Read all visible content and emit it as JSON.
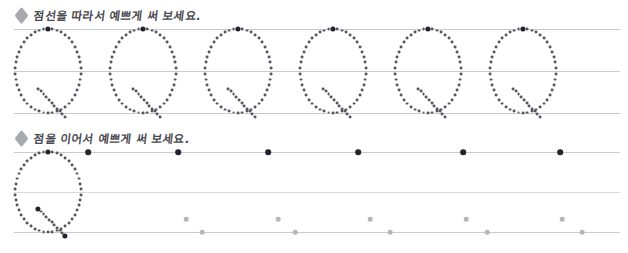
{
  "page": {
    "background_color": "#ffffff"
  },
  "colors": {
    "guide_line": "#c9c9d0",
    "guide_line_soft": "#d9d9df",
    "trace_dot": "#55555f",
    "start_dot": "#23232d",
    "pale_dot": "#b6b6be",
    "bullet": "#9a9aa2",
    "heading_text": "#4a4a52"
  },
  "sections": [
    {
      "id": "trace-section",
      "bullet_icon": "diamond-bullet-icon",
      "heading": "점선을 따라서 예쁘게 써 보세요.",
      "guide_lines": [
        29,
        71,
        113
      ],
      "line_left": 14,
      "line_right": 620,
      "letter": "Q",
      "letter_count": 6,
      "letter_start_x": 48,
      "letter_spacing": 95
    },
    {
      "id": "connect-section",
      "bullet_icon": "diamond-bullet-icon",
      "heading": "점을 이어서 예쁘게 써 보세요.",
      "guide_lines": [
        152,
        192,
        232
      ],
      "line_left": 14,
      "line_right": 620,
      "letter": "Q",
      "example_count": 1,
      "letter_start_x": 48,
      "letter_spacing": 95,
      "top_marker_dots": [
        88,
        178,
        268,
        358,
        463,
        560
      ],
      "mid_marker_dots": [
        186,
        278,
        370,
        466,
        562
      ],
      "bottom_marker_dots": [
        202,
        295,
        390,
        487,
        582
      ]
    }
  ],
  "chart_data": {
    "type": "scatter",
    "xlabel": "",
    "ylabel": "",
    "xlim": [
      0,
      628
    ],
    "ylim": [
      0,
      253
    ],
    "grid": true
  }
}
